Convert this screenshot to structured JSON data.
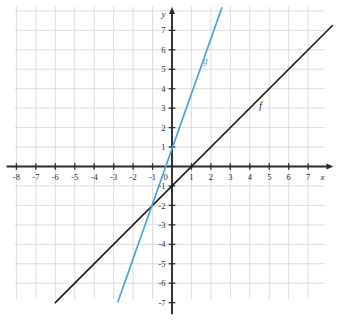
{
  "chart_data": {
    "type": "line",
    "title": "",
    "xlabel": "x",
    "ylabel": "y",
    "xlim": [
      -8.5,
      8.3
    ],
    "ylim": [
      -7.6,
      8.2
    ],
    "grid": true,
    "legend": "inline-labels",
    "x_ticks": [
      -8,
      -7,
      -6,
      -5,
      -4,
      -3,
      -2,
      -1,
      0,
      1,
      2,
      3,
      4,
      5,
      6,
      7
    ],
    "x_tick_labels": [
      "-8",
      "-7",
      "-6",
      "-5",
      "-4",
      "-3",
      "-2",
      "-1",
      "0",
      "1",
      "2",
      "3",
      "4",
      "5",
      "6",
      "7"
    ],
    "y_ticks": [
      -7,
      -6,
      -5,
      -4,
      -3,
      -2,
      -1,
      1,
      2,
      3,
      4,
      5,
      6,
      7
    ],
    "y_tick_labels": [
      "-7",
      "-6",
      "-5",
      "-4",
      "-3",
      "-2",
      "-1",
      "1",
      "2",
      "3",
      "4",
      "5",
      "6",
      "7"
    ],
    "origin_label": "0",
    "series": [
      {
        "name": "f",
        "label": "f",
        "color": "#1c1c1c",
        "slope": 1,
        "intercept": -1,
        "equation": "f(x) = x - 1",
        "x_start": -6.0,
        "x_end": 8.25,
        "y_start": -7.0,
        "y_end": 7.25,
        "label_x": 4.55,
        "label_y": 2.95
      },
      {
        "name": "g",
        "label": "g",
        "color": "#4BA3D3",
        "slope": 3,
        "intercept": 2,
        "equation": "g(x) = 3x + 2",
        "x_start": -2.78,
        "x_end": 2.56,
        "y_start": -6.95,
        "y_end": 8.15,
        "label_x": 1.72,
        "label_y": 5.25
      }
    ],
    "intersection": {
      "x": -1.5,
      "y": -2.5
    }
  },
  "colors": {
    "grid": "#d8d8d8",
    "axis": "#2b2b2b",
    "background": "#ffffff",
    "f_line": "#1c1c1c",
    "g_line": "#4BA3D3"
  }
}
